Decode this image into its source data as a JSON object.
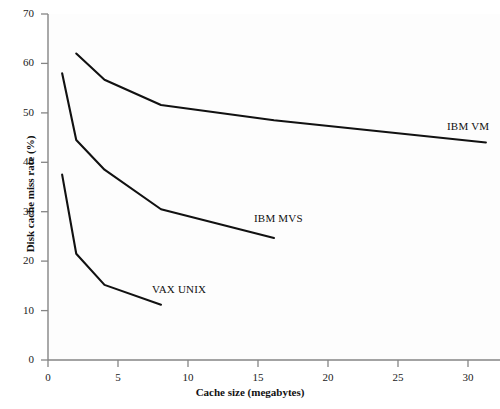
{
  "chart_data": {
    "type": "line",
    "title": "",
    "xlabel": "Cache size (megabytes)",
    "ylabel": "Disk cache miss rate (%)",
    "xlim": [
      0,
      32
    ],
    "ylim": [
      0,
      70
    ],
    "xticks": [
      0,
      5,
      10,
      15,
      20,
      25,
      30
    ],
    "xtick_labels": [
      "0",
      "5",
      "10",
      "15",
      "20",
      "25",
      "30"
    ],
    "yticks": [
      0,
      10,
      20,
      30,
      40,
      50,
      60,
      70
    ],
    "ytick_labels": [
      "0",
      "10",
      "20",
      "30",
      "40",
      "50",
      "60",
      "70"
    ],
    "grid": false,
    "legend_position": "inline-annotations",
    "line_color": "#111111",
    "axis_color": "#808080",
    "background_color": "#fdfdfd",
    "series": [
      {
        "name": "IBM VM",
        "label": "IBM VM",
        "x": [
          2,
          4,
          8,
          16,
          31
        ],
        "y": [
          62.0,
          56.7,
          51.6,
          48.5,
          44.0
        ]
      },
      {
        "name": "IBM MVS",
        "label": "IBM MVS",
        "x": [
          1,
          2,
          4,
          8,
          16
        ],
        "y": [
          58.0,
          44.5,
          38.5,
          30.5,
          24.7
        ]
      },
      {
        "name": "VAX UNIX",
        "label": "VAX UNIX",
        "x": [
          1,
          2,
          4,
          8
        ],
        "y": [
          37.5,
          21.5,
          15.2,
          11.2
        ]
      }
    ]
  },
  "axes": {
    "x_title": "Cache size (megabytes)",
    "y_title": "Disk cache miss rate (%)"
  },
  "ticks": {
    "y": [
      "70",
      "60",
      "50",
      "40",
      "30",
      "20",
      "10",
      "0"
    ],
    "x": [
      "0",
      "5",
      "10",
      "15",
      "20",
      "25",
      "30"
    ]
  },
  "labels": {
    "ibm_vm": "IBM VM",
    "ibm_mvs": "IBM MVS",
    "vax_unix": "VAX UNIX"
  }
}
